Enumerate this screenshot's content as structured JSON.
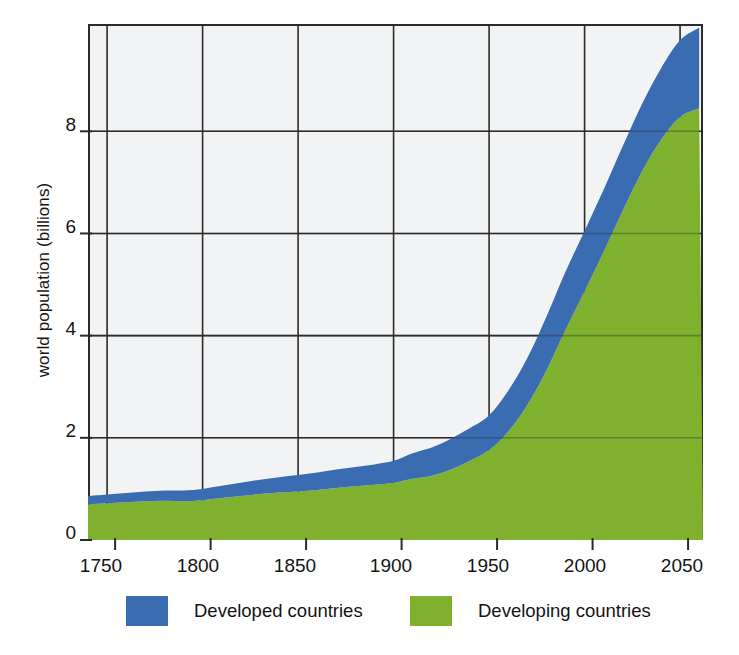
{
  "chart_data": {
    "type": "area",
    "title": "",
    "subtitle": "",
    "xlabel": "",
    "ylabel": "world population (billions)",
    "xlim": [
      1740,
      2062
    ],
    "ylim": [
      0,
      10.1
    ],
    "xticks": [
      1750,
      1800,
      1850,
      1900,
      1950,
      2000,
      2050
    ],
    "yticks": [
      0,
      2,
      4,
      6,
      8
    ],
    "grid": true,
    "stacked": true,
    "legend_position": "bottom",
    "x": [
      1740,
      1750,
      1760,
      1770,
      1780,
      1790,
      1800,
      1810,
      1820,
      1830,
      1840,
      1850,
      1860,
      1870,
      1880,
      1890,
      1900,
      1910,
      1920,
      1930,
      1940,
      1950,
      1960,
      1970,
      1980,
      1990,
      2000,
      2010,
      2020,
      2030,
      2040,
      2050,
      2060
    ],
    "series": [
      {
        "name": "Developing countries",
        "color": "#7fb02e",
        "values": [
          0.7,
          0.72,
          0.74,
          0.76,
          0.77,
          0.76,
          0.78,
          0.82,
          0.86,
          0.9,
          0.93,
          0.95,
          0.98,
          1.02,
          1.05,
          1.08,
          1.12,
          1.2,
          1.26,
          1.38,
          1.55,
          1.76,
          2.12,
          2.64,
          3.32,
          4.11,
          4.87,
          5.64,
          6.45,
          7.21,
          7.83,
          8.28,
          8.45
        ]
      },
      {
        "name": "Developed countries",
        "color": "#3a6cb2",
        "values": [
          0.16,
          0.17,
          0.18,
          0.19,
          0.2,
          0.21,
          0.22,
          0.24,
          0.26,
          0.28,
          0.3,
          0.32,
          0.34,
          0.36,
          0.38,
          0.4,
          0.43,
          0.5,
          0.55,
          0.6,
          0.64,
          0.68,
          0.8,
          0.92,
          1.05,
          1.14,
          1.18,
          1.22,
          1.26,
          1.32,
          1.4,
          1.5,
          1.58
        ]
      }
    ],
    "totals": [
      0.86,
      0.89,
      0.92,
      0.95,
      0.97,
      0.97,
      1.0,
      1.06,
      1.12,
      1.18,
      1.23,
      1.27,
      1.32,
      1.38,
      1.43,
      1.48,
      1.55,
      1.7,
      1.81,
      1.98,
      2.19,
      2.44,
      2.92,
      3.56,
      4.37,
      5.25,
      6.05,
      6.86,
      7.71,
      8.53,
      9.23,
      9.78,
      10.03
    ]
  },
  "axes": {
    "ylabel": "world population (billions)",
    "yticks": [
      "0",
      "2",
      "4",
      "6",
      "8"
    ],
    "xticks": [
      "1750",
      "1800",
      "1850",
      "1900",
      "1950",
      "2000",
      "2050"
    ]
  },
  "legend": {
    "items": [
      {
        "label": "Developed countries",
        "color": "#3a6cb2"
      },
      {
        "label": "Developing countries",
        "color": "#7fb02e"
      }
    ],
    "developed_label": "Developed countries",
    "developing_label": "Developing countries"
  },
  "colors": {
    "developed": "#3a6cb2",
    "developing": "#7fb02e",
    "plot_background": "#f2f3f5",
    "axis": "#2b2b2b",
    "grid": "#2b2b2b",
    "page_background": "#ffffff"
  }
}
